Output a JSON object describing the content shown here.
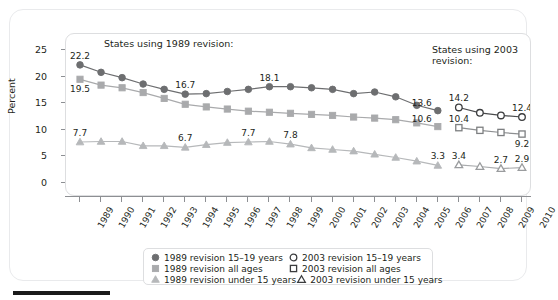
{
  "chart_data": {
    "type": "line",
    "title": "",
    "xlabel": "",
    "ylabel": "Percent",
    "xlim": [
      1989,
      2010
    ],
    "ylim": [
      0,
      25
    ],
    "yticks": [
      0,
      5,
      10,
      15,
      20,
      25
    ],
    "grid": false,
    "legend_position": "bottom",
    "annotations": [
      "States using 1989 revision:",
      "States using 2003 revision:"
    ],
    "x": [
      1989,
      1990,
      1991,
      1992,
      1993,
      1994,
      1995,
      1996,
      1997,
      1998,
      1999,
      2000,
      2001,
      2002,
      2003,
      2004,
      2005,
      2006,
      2007,
      2008,
      2009,
      2010
    ],
    "series": [
      {
        "name": "1989 revision 15–19 years",
        "marker": "filled-circle",
        "color": "#6d6e70",
        "x": [
          1989,
          1990,
          1991,
          1992,
          1993,
          1994,
          1995,
          1996,
          1997,
          1998,
          1999,
          2000,
          2001,
          2002,
          2003,
          2004,
          2005,
          2006
        ],
        "values": [
          22.2,
          20.8,
          19.8,
          18.6,
          17.6,
          16.7,
          16.8,
          17.2,
          17.6,
          18.1,
          18.1,
          17.9,
          17.6,
          16.8,
          17.1,
          16.2,
          14.6,
          13.6
        ]
      },
      {
        "name": "1989 revision all ages",
        "marker": "filled-square",
        "color": "#a9aaac",
        "x": [
          1989,
          1990,
          1991,
          1992,
          1993,
          1994,
          1995,
          1996,
          1997,
          1998,
          1999,
          2000,
          2001,
          2002,
          2003,
          2004,
          2005,
          2006
        ],
        "values": [
          19.5,
          18.4,
          17.9,
          17.0,
          15.9,
          14.8,
          14.3,
          13.9,
          13.5,
          13.3,
          13.1,
          12.9,
          12.7,
          12.4,
          12.2,
          11.9,
          11.3,
          10.6
        ]
      },
      {
        "name": "1989 revision under 15 years",
        "marker": "filled-triangle",
        "color": "#b6b8ba",
        "x": [
          1989,
          1990,
          1991,
          1992,
          1993,
          1994,
          1995,
          1996,
          1997,
          1998,
          1999,
          2000,
          2001,
          2002,
          2003,
          2004,
          2005,
          2006
        ],
        "values": [
          7.7,
          7.8,
          7.8,
          7.0,
          7.0,
          6.7,
          7.2,
          7.6,
          7.7,
          7.8,
          7.3,
          6.6,
          6.3,
          6.0,
          5.4,
          4.8,
          4.1,
          3.3
        ]
      },
      {
        "name": "2003 revision 15–19 years",
        "marker": "open-circle",
        "color": "#6d6e70",
        "x": [
          2007,
          2008,
          2009,
          2010
        ],
        "values": [
          14.2,
          13.2,
          12.7,
          12.4
        ]
      },
      {
        "name": "2003 revision all ages",
        "marker": "open-square",
        "color": "#a9aaac",
        "x": [
          2007,
          2008,
          2009,
          2010
        ],
        "values": [
          10.4,
          9.9,
          9.5,
          9.2
        ]
      },
      {
        "name": "2003 revision under 15 years",
        "marker": "open-triangle",
        "color": "#b6b8ba",
        "x": [
          2007,
          2008,
          2009,
          2010
        ],
        "values": [
          3.4,
          3.1,
          2.7,
          2.9
        ]
      }
    ],
    "point_labels": [
      {
        "series": 0,
        "x": 1989,
        "value": "22.2",
        "pos": "above"
      },
      {
        "series": 0,
        "x": 1994,
        "value": "16.7",
        "pos": "above"
      },
      {
        "series": 0,
        "x": 1998,
        "value": "18.1",
        "pos": "above"
      },
      {
        "series": 0,
        "x": 2006,
        "value": "13.6",
        "pos": "left"
      },
      {
        "series": 1,
        "x": 1989,
        "value": "19.5",
        "pos": "below"
      },
      {
        "series": 1,
        "x": 2006,
        "value": "10.6",
        "pos": "left"
      },
      {
        "series": 2,
        "x": 1989,
        "value": "7.7",
        "pos": "above"
      },
      {
        "series": 2,
        "x": 1994,
        "value": "6.7",
        "pos": "above"
      },
      {
        "series": 2,
        "x": 1997,
        "value": "7.7",
        "pos": "above"
      },
      {
        "series": 2,
        "x": 1999,
        "value": "7.8",
        "pos": "above"
      },
      {
        "series": 2,
        "x": 2006,
        "value": "3.3",
        "pos": "above"
      },
      {
        "series": 3,
        "x": 2007,
        "value": "14.2",
        "pos": "above"
      },
      {
        "series": 3,
        "x": 2010,
        "value": "12.4",
        "pos": "above"
      },
      {
        "series": 4,
        "x": 2007,
        "value": "10.4",
        "pos": "above"
      },
      {
        "series": 4,
        "x": 2010,
        "value": "9.2",
        "pos": "below"
      },
      {
        "series": 5,
        "x": 2007,
        "value": "3.4",
        "pos": "above"
      },
      {
        "series": 5,
        "x": 2009,
        "value": "2.7",
        "pos": "above"
      },
      {
        "series": 5,
        "x": 2010,
        "value": "2.9",
        "pos": "above"
      }
    ]
  },
  "axes": {
    "y_title": "Percent",
    "y_tick_labels": [
      "0",
      "5",
      "10",
      "15",
      "20",
      "25"
    ],
    "x_tick_labels": [
      "1989",
      "1990",
      "1991",
      "1992",
      "1993",
      "1994",
      "1995",
      "1996",
      "1997",
      "1998",
      "1999",
      "2000",
      "2001",
      "2002",
      "2003",
      "2004",
      "2005",
      "2006",
      "2007",
      "2008",
      "2009",
      "2010"
    ]
  },
  "notes": {
    "left": "States using 1989 revision:",
    "right": "States using 2003\nrevision:"
  },
  "legend": {
    "rows": [
      {
        "left": {
          "label": "1989 revision 15–19 years",
          "marker": "filled-circle",
          "color": "#6d6e70"
        },
        "right": {
          "label": "2003 revision 15–19 years",
          "marker": "open-circle",
          "color": "#231f20"
        }
      },
      {
        "left": {
          "label": "1989 revision all ages",
          "marker": "filled-square",
          "color": "#a9aaac"
        },
        "right": {
          "label": "2003 revision all ages",
          "marker": "open-square",
          "color": "#6d6e70"
        }
      },
      {
        "left": {
          "label": "1989 revision under 15 years",
          "marker": "filled-triangle",
          "color": "#b6b8ba"
        },
        "right": {
          "label": "2003 revision under 15 years",
          "marker": "open-triangle",
          "color": "#9a9c9e"
        }
      }
    ]
  },
  "colors": {
    "teen": "#6d6e70",
    "all_ages": "#a9aaac",
    "under15": "#b6b8ba",
    "text": "#231f20",
    "frame": "#dddee0"
  }
}
